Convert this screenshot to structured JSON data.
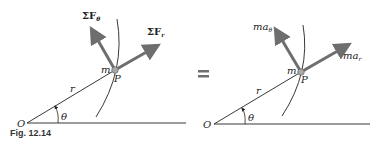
{
  "figure": {
    "caption": "Fig. 12.14",
    "equals_sign": "=",
    "left_panel": {
      "origin_label": "O",
      "radius_label": "r",
      "angle_label": "θ",
      "mass_label": "m",
      "point_label": "P",
      "force_theta_label": "ΣF",
      "force_theta_sub": "θ",
      "force_r_label": "ΣF",
      "force_r_sub": "r"
    },
    "right_panel": {
      "origin_label": "O",
      "radius_label": "r",
      "angle_label": "θ",
      "mass_label": "m",
      "point_label": "P",
      "accel_theta_label": "ma",
      "accel_theta_sub": "θ",
      "accel_r_label": "ma",
      "accel_r_sub": "r"
    },
    "colors": {
      "arrow": "#6e6e6e",
      "line": "#222222",
      "particle": "#a8a8a8"
    }
  }
}
